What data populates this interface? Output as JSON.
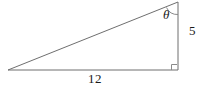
{
  "figure": {
    "type": "right-triangle-diagram",
    "background_color": "#ffffff",
    "stroke_color": "#6e6e6e",
    "text_color": "#1a1a1a",
    "labels": {
      "base": "12",
      "vertical": "5",
      "angle": "θ"
    },
    "vertices": {
      "left": "8,70",
      "bottom_right": "178,70",
      "top_right": "178,2"
    },
    "markers": {
      "right_angle": "square",
      "angle_arc": "arc"
    }
  }
}
